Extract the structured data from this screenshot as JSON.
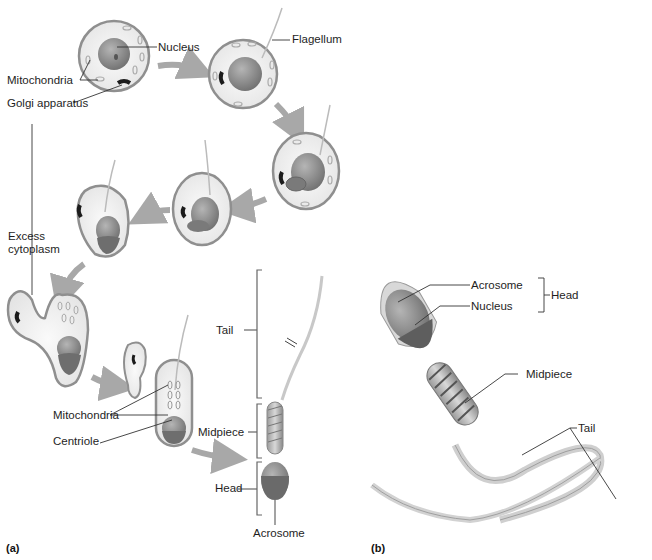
{
  "figure": {
    "panel_a": {
      "tag": "(a)",
      "labels": {
        "nucleus": "Nucleus",
        "mitochondria_top": "Mitochondria",
        "golgi": "Golgi apparatus",
        "flagellum": "Flagellum",
        "excess_cytoplasm_1": "Excess",
        "excess_cytoplasm_2": "cytoplasm",
        "mitochondria_bottom": "Mitochondria",
        "centriole": "Centriole",
        "tail": "Tail",
        "midpiece": "Midpiece",
        "head": "Head",
        "acrosome": "Acrosome"
      }
    },
    "panel_b": {
      "tag": "(b)",
      "labels": {
        "acrosome": "Acrosome",
        "nucleus": "Nucleus",
        "head": "Head",
        "midpiece": "Midpiece",
        "tail": "Tail"
      }
    },
    "colors": {
      "membrane": "#8f8f8f",
      "cytoplasm": "#efefef",
      "nucleus": "#8a8a8a",
      "acrosome": "#6e6e6e",
      "arrow": "#a8a8a8",
      "golgi": "#1c1c1c"
    }
  }
}
